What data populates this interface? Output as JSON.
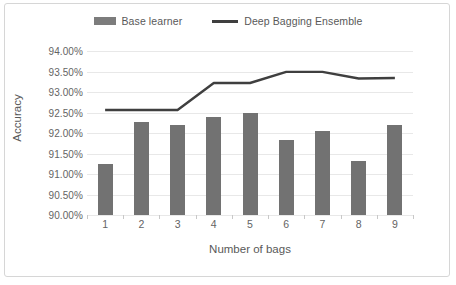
{
  "chart_data": {
    "type": "bar",
    "title": "",
    "xlabel": "Number of bags",
    "ylabel": "Accuracy",
    "categories": [
      "1",
      "2",
      "3",
      "4",
      "5",
      "6",
      "7",
      "8",
      "9"
    ],
    "ylim": [
      90.0,
      94.0
    ],
    "ytick_labels": [
      "90.00%",
      "90.50%",
      "91.00%",
      "91.50%",
      "92.00%",
      "92.50%",
      "93.00%",
      "93.50%",
      "94.00%"
    ],
    "ytick_values": [
      90.0,
      90.5,
      91.0,
      91.5,
      92.0,
      92.5,
      93.0,
      93.5,
      94.0
    ],
    "grid": true,
    "legend_position": "top-center",
    "series": [
      {
        "name": "Base learner",
        "type": "bar",
        "color": "#727272",
        "values": [
          91.25,
          92.27,
          92.19,
          92.38,
          92.48,
          91.84,
          92.05,
          91.31,
          92.2
        ]
      },
      {
        "name": "Deep Bagging Ensemble",
        "type": "line",
        "color": "#3f3f3f",
        "values": [
          92.56,
          92.56,
          92.56,
          93.22,
          93.22,
          93.49,
          93.49,
          93.33,
          93.34
        ]
      }
    ]
  },
  "legend": {
    "items": [
      {
        "label": "Base learner",
        "swatch": "bar-swatch"
      },
      {
        "label": "Deep Bagging Ensemble",
        "swatch": "line-swatch"
      }
    ]
  },
  "axes": {
    "y_title": "Accuracy",
    "x_title": "Number of bags"
  }
}
